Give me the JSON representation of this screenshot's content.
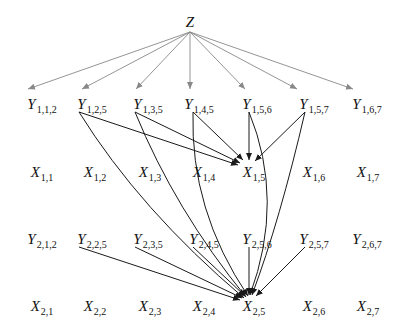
{
  "diagram": {
    "type": "graphical-model",
    "colors": {
      "z_edges": "#888888",
      "edges": "#1a1a1a",
      "text": "#111111",
      "background": "#ffffff"
    },
    "nodes": [
      {
        "id": "Z",
        "base": "Z",
        "sub": "",
        "x": 190,
        "y": 22
      },
      {
        "id": "Y112",
        "base": "Y",
        "sub": "1,1,2",
        "x": 42,
        "y": 104
      },
      {
        "id": "Y125",
        "base": "Y",
        "sub": "1,2,5",
        "x": 92,
        "y": 104
      },
      {
        "id": "Y135",
        "base": "Y",
        "sub": "1,3,5",
        "x": 148,
        "y": 104
      },
      {
        "id": "Y145",
        "base": "Y",
        "sub": "1,4,5",
        "x": 199,
        "y": 104
      },
      {
        "id": "Y156",
        "base": "Y",
        "sub": "1,5,6",
        "x": 257,
        "y": 104
      },
      {
        "id": "Y157",
        "base": "Y",
        "sub": "1,5,7",
        "x": 314,
        "y": 104
      },
      {
        "id": "Y167",
        "base": "Y",
        "sub": "1,6,7",
        "x": 367,
        "y": 104
      },
      {
        "id": "X11",
        "base": "X",
        "sub": "1,1",
        "x": 42,
        "y": 172
      },
      {
        "id": "X12",
        "base": "X",
        "sub": "1,2",
        "x": 95,
        "y": 172
      },
      {
        "id": "X13",
        "base": "X",
        "sub": "1,3",
        "x": 150,
        "y": 172
      },
      {
        "id": "X14",
        "base": "X",
        "sub": "1,4",
        "x": 204,
        "y": 172
      },
      {
        "id": "X15",
        "base": "X",
        "sub": "1,5",
        "x": 254,
        "y": 172
      },
      {
        "id": "X16",
        "base": "X",
        "sub": "1,6",
        "x": 314,
        "y": 172
      },
      {
        "id": "X17",
        "base": "X",
        "sub": "1,7",
        "x": 368,
        "y": 172
      },
      {
        "id": "Y212",
        "base": "Y",
        "sub": "2,1,2",
        "x": 42,
        "y": 239
      },
      {
        "id": "Y225",
        "base": "Y",
        "sub": "2,2,5",
        "x": 92,
        "y": 239
      },
      {
        "id": "Y235",
        "base": "Y",
        "sub": "2,3,5",
        "x": 148,
        "y": 239
      },
      {
        "id": "Y245",
        "base": "Y",
        "sub": "2,4,5",
        "x": 204,
        "y": 239
      },
      {
        "id": "Y256",
        "base": "Y",
        "sub": "2,5,6",
        "x": 257,
        "y": 239
      },
      {
        "id": "Y257",
        "base": "Y",
        "sub": "2,5,7",
        "x": 314,
        "y": 239
      },
      {
        "id": "Y267",
        "base": "Y",
        "sub": "2,6,7",
        "x": 367,
        "y": 239
      },
      {
        "id": "X21",
        "base": "X",
        "sub": "2,1",
        "x": 42,
        "y": 306
      },
      {
        "id": "X22",
        "base": "X",
        "sub": "2,2",
        "x": 95,
        "y": 306
      },
      {
        "id": "X23",
        "base": "X",
        "sub": "2,3",
        "x": 150,
        "y": 306
      },
      {
        "id": "X24",
        "base": "X",
        "sub": "2,4",
        "x": 204,
        "y": 306
      },
      {
        "id": "X25",
        "base": "X",
        "sub": "2,5",
        "x": 254,
        "y": 306
      },
      {
        "id": "X26",
        "base": "X",
        "sub": "2,6",
        "x": 314,
        "y": 306
      },
      {
        "id": "X27",
        "base": "X",
        "sub": "2,7",
        "x": 368,
        "y": 306
      }
    ],
    "edges": [
      {
        "from": "Z",
        "to": "Y112",
        "style": "gray",
        "d": "M190,32 L28,89"
      },
      {
        "from": "Z",
        "to": "Y125",
        "style": "gray",
        "d": "M190,32 L82,89"
      },
      {
        "from": "Z",
        "to": "Y135",
        "style": "gray",
        "d": "M190,32 L136,89"
      },
      {
        "from": "Z",
        "to": "Y145",
        "style": "gray",
        "d": "M190,32 L190,89"
      },
      {
        "from": "Z",
        "to": "Y156",
        "style": "gray",
        "d": "M190,32 L245,89"
      },
      {
        "from": "Z",
        "to": "Y157",
        "style": "gray",
        "d": "M190,32 L297,89"
      },
      {
        "from": "Z",
        "to": "Y167",
        "style": "gray",
        "d": "M190,32 L353,89"
      },
      {
        "from": "Y125",
        "to": "X15",
        "style": "dark",
        "d": "M79,112 L238,165"
      },
      {
        "from": "Y135",
        "to": "X15",
        "style": "dark",
        "d": "M135,112 L240,163"
      },
      {
        "from": "Y145",
        "to": "X15",
        "style": "dark",
        "d": "M193,112 L243,160"
      },
      {
        "from": "Y156",
        "to": "X15",
        "style": "dark",
        "d": "M249,112 L249,160"
      },
      {
        "from": "Y157",
        "to": "X15",
        "style": "dark",
        "d": "M305,112 L255,161"
      },
      {
        "from": "Y125",
        "to": "X25",
        "style": "dark",
        "d": "M79,112 Q140,210 244,298"
      },
      {
        "from": "Y135",
        "to": "X25",
        "style": "dark",
        "d": "M135,112 Q175,210 246,297"
      },
      {
        "from": "Y145",
        "to": "X25",
        "style": "dark",
        "d": "M193,112 Q190,210 248,296"
      },
      {
        "from": "Y156",
        "to": "X25",
        "style": "dark",
        "d": "M249,112 Q285,200 250,295"
      },
      {
        "from": "Y157",
        "to": "X25",
        "style": "dark",
        "d": "M305,112 Q280,220 252,295"
      },
      {
        "from": "Y225",
        "to": "X25",
        "style": "dark",
        "d": "M79,247 L240,300"
      },
      {
        "from": "Y235",
        "to": "X25",
        "style": "dark",
        "d": "M135,247 L242,298"
      },
      {
        "from": "Y245",
        "to": "X25",
        "style": "dark",
        "d": "M193,247 L245,296"
      },
      {
        "from": "Y256",
        "to": "X25",
        "style": "dark",
        "d": "M249,247 L249,295"
      },
      {
        "from": "Y257",
        "to": "X25",
        "style": "dark",
        "d": "M305,247 L256,296"
      }
    ]
  }
}
